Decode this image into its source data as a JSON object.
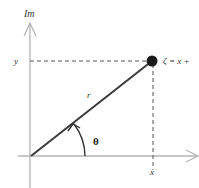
{
  "diagram": {
    "labels": {
      "imaginary_axis": "Im",
      "y_tick": "y",
      "x_tick": "x",
      "radius": "r",
      "angle": "θ",
      "point": "ζ = x +"
    },
    "colors": {
      "axis": "#b5b5b5",
      "radius_line": "#3a3a3a",
      "point": "#1a1a1a",
      "dashed": "#555555",
      "text": "#333333"
    },
    "geometry": {
      "origin": [
        31,
        156
      ],
      "point": [
        152,
        61
      ],
      "point_radius": 5
    }
  }
}
